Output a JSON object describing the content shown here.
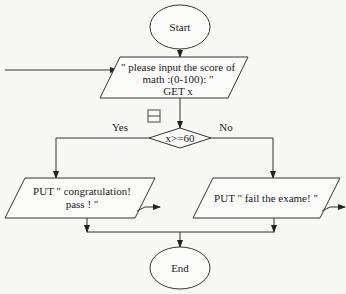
{
  "diagram": {
    "type": "flowchart",
    "nodes": {
      "start": {
        "shape": "ellipse",
        "label": "Start"
      },
      "input": {
        "shape": "parallelogram",
        "lines": [
          "\" please input the score of",
          "math :(0-100): \"",
          "GET x"
        ]
      },
      "decision": {
        "shape": "diamond",
        "label": "x>=60"
      },
      "pass_output": {
        "shape": "parallelogram",
        "lines": [
          "PUT  \" congratulation!",
          "pass ! \""
        ]
      },
      "fail_output": {
        "shape": "parallelogram",
        "lines": [
          "PUT \" fail the exame! \""
        ]
      },
      "end": {
        "shape": "ellipse",
        "label": "End"
      }
    },
    "branches": {
      "yes": "Yes",
      "no": "No"
    },
    "edges": [
      {
        "from": "start",
        "to": "input"
      },
      {
        "from": "input",
        "to": "decision"
      },
      {
        "from": "decision",
        "to": "pass_output",
        "label": "Yes"
      },
      {
        "from": "decision",
        "to": "fail_output",
        "label": "No"
      },
      {
        "from": "pass_output",
        "to": "end"
      },
      {
        "from": "fail_output",
        "to": "end"
      }
    ],
    "icons": {
      "collapse": "minus-box-icon"
    }
  }
}
